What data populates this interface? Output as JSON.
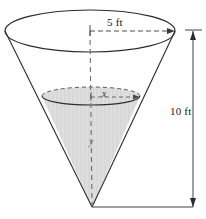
{
  "figure": {
    "shape": "inverted-circular-cone",
    "background_color": "#fefefe",
    "stroke_color": "#2b2b2b",
    "fill_color": "#dcdcdc",
    "hatch_color": "#c4c4c4"
  },
  "labels": {
    "top_radius": "5 ft",
    "total_height": "10 ft",
    "liquid_radius": "x",
    "liquid_height": "y"
  },
  "dimensions": {
    "top_radius_value": 5,
    "top_radius_units": "ft",
    "total_height_value": 10,
    "total_height_units": "ft",
    "liquid_radius_variable": "x",
    "liquid_height_variable": "y"
  },
  "geometry": {
    "top_ellipse": {
      "cx": 90,
      "cy": 31,
      "rx": 85,
      "ry": 21
    },
    "liquid_ellipse": {
      "cx": 91,
      "cy": 96,
      "rx": 49,
      "ry": 9
    },
    "apex": {
      "x": 92,
      "y": 207
    },
    "radius_dimension_line": {
      "x1": 90,
      "y1": 31,
      "x2": 175,
      "y2": 31
    },
    "height_dimension_line": {
      "x": 193,
      "y1": 31,
      "y2": 207
    }
  }
}
